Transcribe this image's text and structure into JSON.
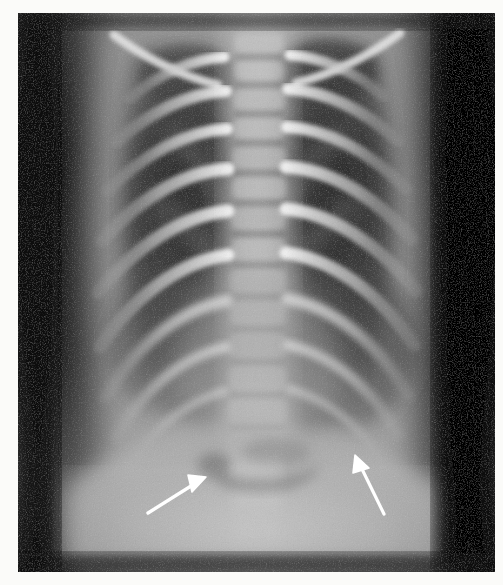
{
  "image": {
    "kind": "radiograph",
    "modality": "X-ray",
    "view": "AP chest",
    "subject": "infant chest",
    "title": "Pediatric AP chest radiograph",
    "background_color": "#0d0d0d",
    "paper_color": "#fbfbf9",
    "plate": {
      "x": 18,
      "y": 13,
      "width": 477,
      "height": 559
    }
  },
  "tones": {
    "darkest": "#0d0d0d",
    "lung_field": "#5d5d5d",
    "soft_tissue": "#8e8e8e",
    "mediastinum": "#a8a8a8",
    "bone": "#d6d6d6",
    "bone_bright": "#ececec",
    "annotation": "#ffffff"
  },
  "anatomy": {
    "regions": [
      {
        "name": "right-lung-field",
        "label": "Right lung field"
      },
      {
        "name": "left-lung-field",
        "label": "Left lung field"
      },
      {
        "name": "mediastinum",
        "label": "Mediastinum / spine"
      },
      {
        "name": "clavicle-left",
        "label": "Left clavicle"
      },
      {
        "name": "clavicle-right",
        "label": "Right clavicle"
      },
      {
        "name": "ribcage",
        "label": "Rib cage"
      },
      {
        "name": "diaphragm",
        "label": "Diaphragm"
      },
      {
        "name": "abdomen",
        "label": "Upper abdomen"
      }
    ],
    "rib_pair_count": 9,
    "vertebra_count": 11
  },
  "annotations": {
    "arrows": [
      {
        "name": "arrow-left",
        "label": "Left annotation arrow",
        "direction": "up-right",
        "tail": {
          "x": 130,
          "y": 500
        },
        "tip": {
          "x": 188,
          "y": 464
        },
        "color": "#ffffff",
        "points_to": "diaphragm"
      },
      {
        "name": "arrow-right",
        "label": "Right annotation arrow",
        "direction": "up-left",
        "tail": {
          "x": 366,
          "y": 501
        },
        "tip": {
          "x": 337,
          "y": 442
        },
        "color": "#ffffff",
        "points_to": "left-cardiophrenic-angle"
      }
    ]
  }
}
